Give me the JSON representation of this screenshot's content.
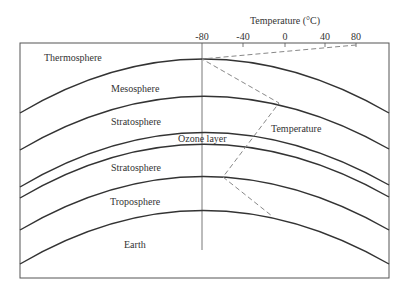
{
  "diagram": {
    "axis": {
      "title": "Temperature (°C)",
      "ticks": [
        "-80",
        "-40",
        "0",
        "40",
        "80"
      ]
    },
    "layers": [
      {
        "label": "Thermosphere"
      },
      {
        "label": "Mesosphere"
      },
      {
        "label": "Stratosphere"
      },
      {
        "label": "Ozone layer"
      },
      {
        "label": "Stratosphere"
      },
      {
        "label": "Troposphere"
      },
      {
        "label": "Earth"
      }
    ],
    "temperature_label": "Temperature",
    "colors": {
      "boundary": "#333333",
      "frame": "#555555",
      "temperature_line": "#888888"
    }
  }
}
